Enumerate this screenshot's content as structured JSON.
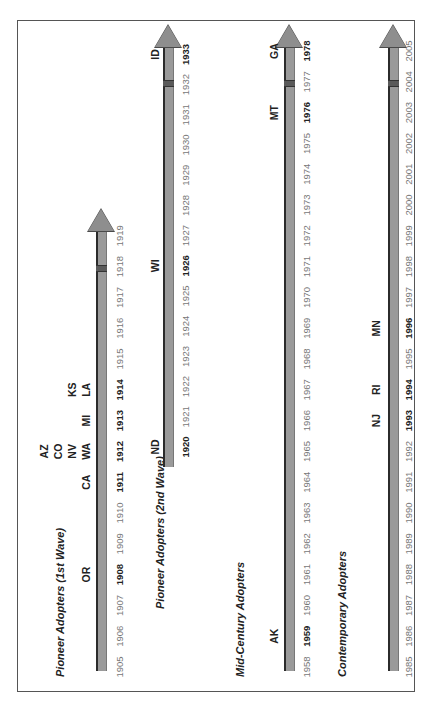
{
  "diagram": {
    "orientation": "rotated 90 degrees counter-clockwise (text reads bottom-to-top)",
    "rows": [
      {
        "title": "Pioneer Adopters (1st Wave)",
        "years": [
          "1905",
          "1906",
          "1907",
          "1908",
          "1909",
          "1910",
          "1911",
          "1912",
          "1913",
          "1914",
          "1915",
          "1916",
          "1917",
          "1918",
          "1919"
        ],
        "bold_years": [
          "1908",
          "1911",
          "1912",
          "1913",
          "1914"
        ],
        "states": [
          {
            "label": "OR",
            "year": "1908"
          },
          {
            "label": "CA",
            "year": "1911"
          },
          {
            "label": "WA",
            "year": "1912"
          },
          {
            "label": "NV",
            "year": "1912"
          },
          {
            "label": "CO",
            "year": "1912"
          },
          {
            "label": "AZ",
            "year": "1912"
          },
          {
            "label": "MI",
            "year": "1913"
          },
          {
            "label": "LA",
            "year": "1914"
          },
          {
            "label": "KS",
            "year": "1914"
          }
        ]
      },
      {
        "title": "Pioneer Adopters (2nd Wave)",
        "years": [
          "1920",
          "1921",
          "1922",
          "1923",
          "1924",
          "1925",
          "1926",
          "1927",
          "1928",
          "1929",
          "1930",
          "1931",
          "1932",
          "1933"
        ],
        "bold_years": [
          "1920",
          "1926",
          "1933"
        ],
        "states": [
          {
            "label": "ND",
            "year": "1920"
          },
          {
            "label": "WI",
            "year": "1926"
          },
          {
            "label": "ID",
            "year": "1933"
          }
        ]
      },
      {
        "title": "Mid-Century Adopters",
        "years": [
          "1958",
          "1959",
          "1960",
          "1961",
          "1962",
          "1963",
          "1964",
          "1965",
          "1966",
          "1967",
          "1968",
          "1969",
          "1970",
          "1971",
          "1972",
          "1973",
          "1974",
          "1975",
          "1976",
          "1977",
          "1978"
        ],
        "bold_years": [
          "1959",
          "1976",
          "1978"
        ],
        "states": [
          {
            "label": "AK",
            "year": "1959"
          },
          {
            "label": "MT",
            "year": "1976"
          },
          {
            "label": "GA",
            "year": "1978"
          }
        ]
      },
      {
        "title": "Contemporary Adopters",
        "years": [
          "1985",
          "1986",
          "1987",
          "1988",
          "1989",
          "1990",
          "1991",
          "1992",
          "1993",
          "1994",
          "1995",
          "1996",
          "1997",
          "1998",
          "1999",
          "2000",
          "2001",
          "2002",
          "2003",
          "2004",
          "2005"
        ],
        "bold_years": [
          "1993",
          "1994",
          "1996"
        ],
        "states": [
          {
            "label": "NJ",
            "year": "1993"
          },
          {
            "label": "RI",
            "year": "1994"
          },
          {
            "label": "MN",
            "year": "1996"
          }
        ]
      }
    ]
  },
  "colors": {
    "bar_fill": "#9a9a9a",
    "bar_edge": "#2b2b2b",
    "frame": "#555555",
    "year_normal": "#777777",
    "year_bold": "#222222"
  }
}
